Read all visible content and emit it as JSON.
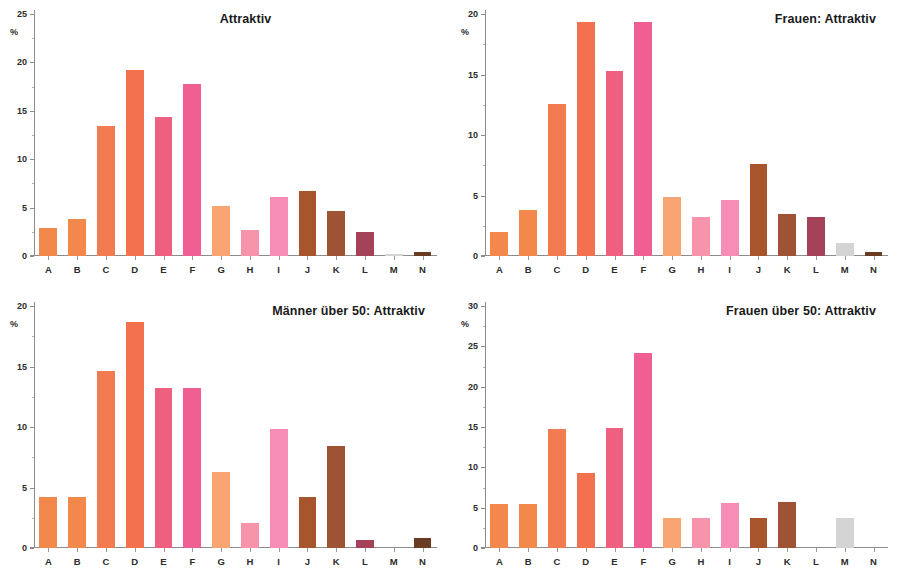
{
  "figure": {
    "background": "#ffffff",
    "axis_color": "#8c8c8c",
    "text_color": "#1a1a1a",
    "categories": [
      "A",
      "B",
      "C",
      "D",
      "E",
      "F",
      "G",
      "H",
      "I",
      "J",
      "K",
      "L",
      "M",
      "N"
    ],
    "bar_colors": [
      "#f2884c",
      "#f2884c",
      "#f37b52",
      "#f4714f",
      "#ef6080",
      "#ef5f93",
      "#f9a473",
      "#f794ab",
      "#f58db4",
      "#a8552e",
      "#9e5334",
      "#a34258",
      "#d4d4d4",
      "#6b3b24"
    ],
    "unit_label": "%"
  },
  "chart_data": [
    {
      "type": "bar",
      "id": "attraktiv-gesamt",
      "title": "Attraktiv",
      "title_align": "center",
      "xlabel": "",
      "ylabel": "%",
      "ylim": [
        0,
        25
      ],
      "yticks": [
        0,
        5,
        10,
        15,
        20,
        25
      ],
      "grid": false,
      "legend": "none",
      "categories": [
        "A",
        "B",
        "C",
        "D",
        "E",
        "F",
        "G",
        "H",
        "I",
        "J",
        "K",
        "L",
        "M",
        "N"
      ],
      "values": [
        2.9,
        3.8,
        13.4,
        19.2,
        14.4,
        17.8,
        5.2,
        2.7,
        6.1,
        6.7,
        4.6,
        2.5,
        0.2,
        0.4
      ]
    },
    {
      "type": "bar",
      "id": "frauen-attraktiv",
      "title": "Frauen: Attraktiv",
      "title_align": "right",
      "xlabel": "",
      "ylabel": "%",
      "ylim": [
        0,
        20
      ],
      "yticks": [
        0,
        5,
        10,
        15,
        20
      ],
      "grid": false,
      "legend": "none",
      "categories": [
        "A",
        "B",
        "C",
        "D",
        "E",
        "F",
        "G",
        "H",
        "I",
        "J",
        "K",
        "L",
        "M",
        "N"
      ],
      "values": [
        2.0,
        3.8,
        12.6,
        19.3,
        15.3,
        19.3,
        4.9,
        3.2,
        4.6,
        7.6,
        3.5,
        3.2,
        1.1,
        0.3
      ]
    },
    {
      "type": "bar",
      "id": "maenner-ueber-50-attraktiv",
      "title": "Männer über 50: Attraktiv",
      "title_align": "right",
      "xlabel": "",
      "ylabel": "%",
      "ylim": [
        0,
        20
      ],
      "yticks": [
        0,
        5,
        10,
        15,
        20
      ],
      "grid": false,
      "legend": "none",
      "categories": [
        "A",
        "B",
        "C",
        "D",
        "E",
        "F",
        "G",
        "H",
        "I",
        "J",
        "K",
        "L",
        "M",
        "N"
      ],
      "values": [
        4.2,
        4.2,
        14.6,
        18.7,
        13.2,
        13.2,
        6.3,
        2.1,
        9.8,
        4.2,
        8.4,
        0.7,
        0.0,
        0.8
      ]
    },
    {
      "type": "bar",
      "id": "frauen-ueber-50-attraktiv",
      "title": "Frauen über 50: Attraktiv",
      "title_align": "right",
      "xlabel": "",
      "ylabel": "%",
      "ylim": [
        0,
        30
      ],
      "yticks": [
        0,
        5,
        10,
        15,
        20,
        25,
        30
      ],
      "grid": false,
      "legend": "none",
      "categories": [
        "A",
        "B",
        "C",
        "D",
        "E",
        "F",
        "G",
        "H",
        "I",
        "J",
        "K",
        "L",
        "M",
        "N"
      ],
      "values": [
        5.5,
        5.5,
        14.8,
        9.3,
        14.9,
        24.2,
        3.7,
        3.7,
        5.6,
        3.7,
        5.7,
        0.0,
        3.7,
        0.0
      ]
    }
  ]
}
